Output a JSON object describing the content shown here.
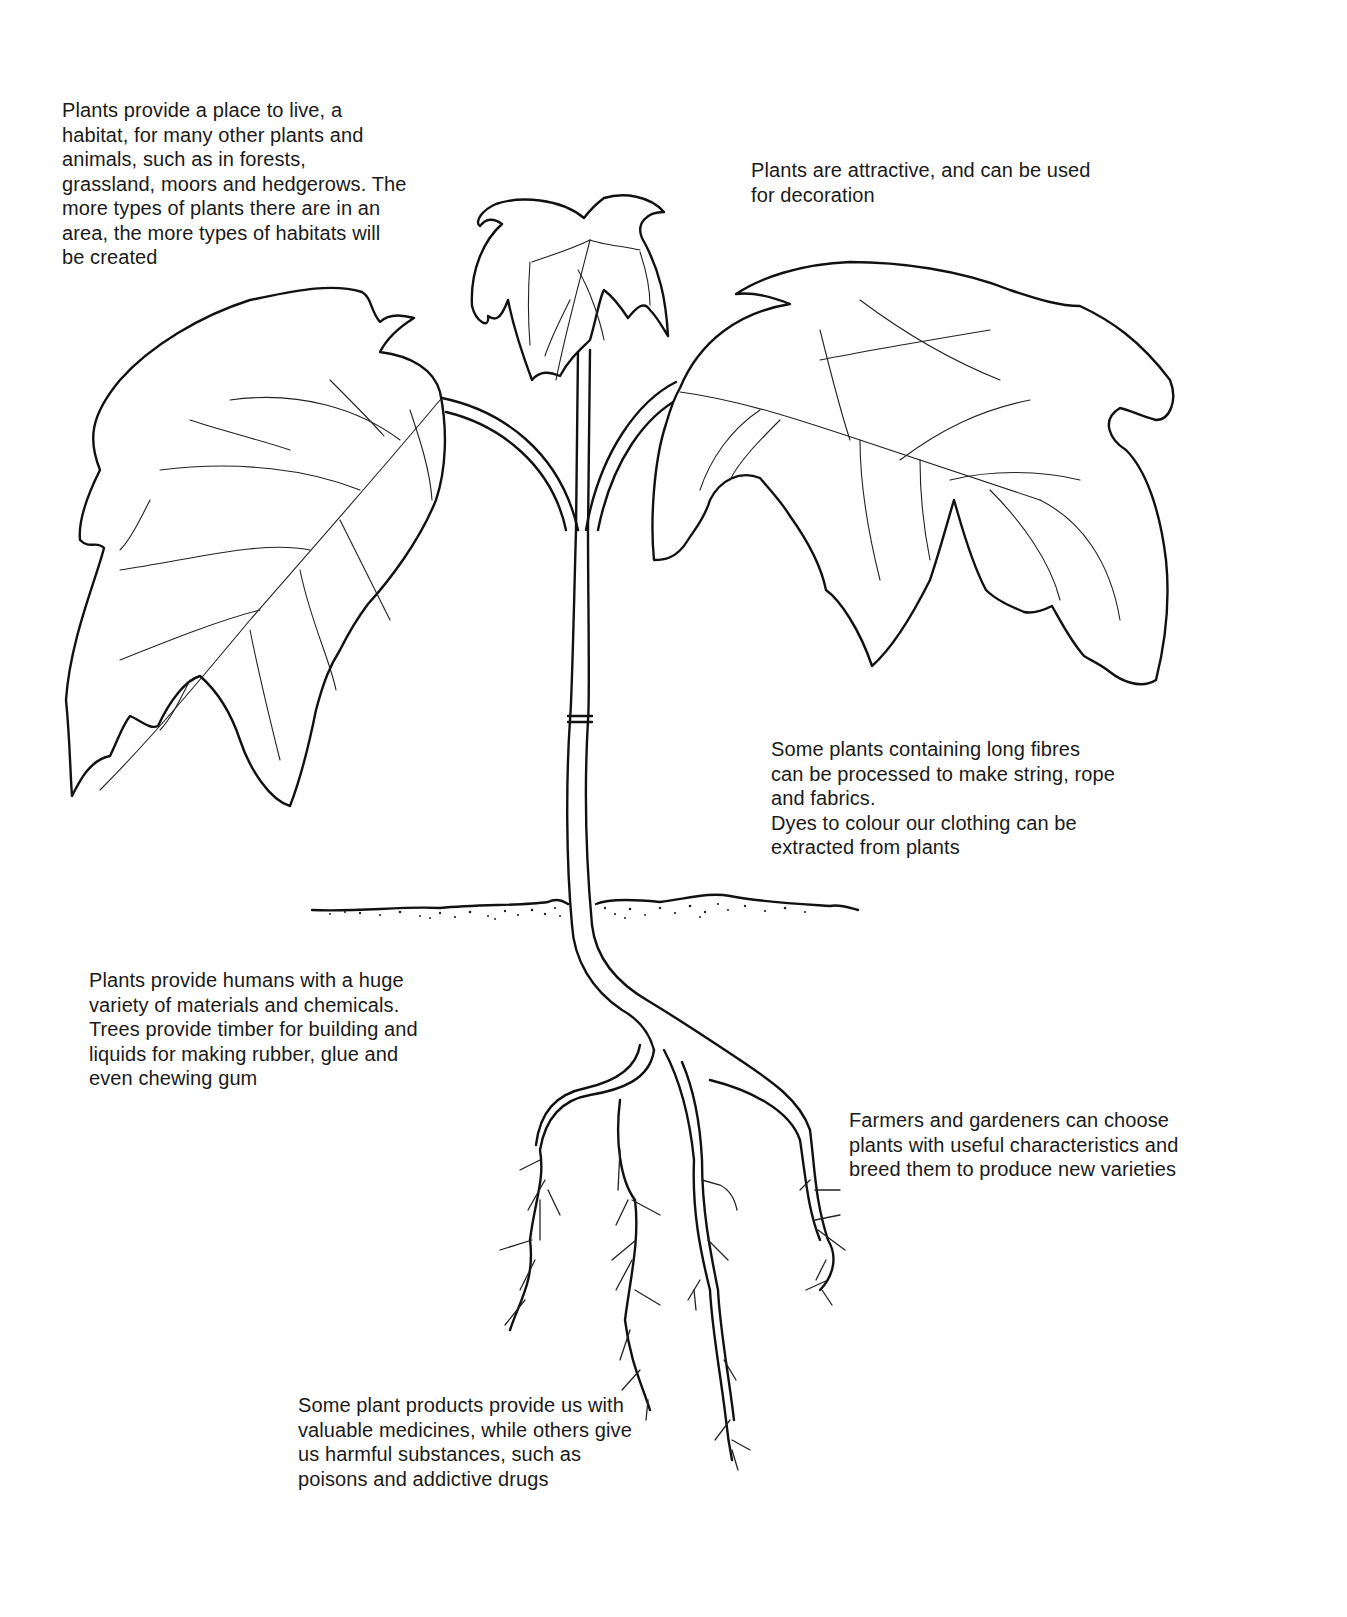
{
  "diagram": {
    "subject": "plant",
    "captions": {
      "habitat": "Plants provide a place to live, a\nhabitat, for many other plants and\nanimals, such as in forests,\ngrassland, moors and hedgerows. The\nmore types of plants there are in an\narea, the more types of habitats will\nbe created",
      "decoration": "Plants are attractive, and can be used\nfor decoration",
      "fibres": "Some plants containing long fibres\ncan be processed to make string, rope\nand fabrics.\nDyes to colour our clothing can be\nextracted from plants",
      "materials": "Plants provide humans with a huge\nvariety of materials and chemicals.\nTrees provide timber for building and\nliquids for making rubber, glue and\neven chewing gum",
      "breeding": "Farmers and gardeners can choose\nplants with useful characteristics and\nbreed them to produce new varieties",
      "medicines": "Some plant products provide us with\nvaluable medicines, while others give\nus harmful substances, such as\npoisons and addictive drugs"
    },
    "parts": [
      "top-leaf",
      "left-leaf",
      "right-leaf",
      "stem",
      "soil-line",
      "roots"
    ],
    "colors": {
      "ink": "#111111",
      "background": "#ffffff"
    }
  }
}
